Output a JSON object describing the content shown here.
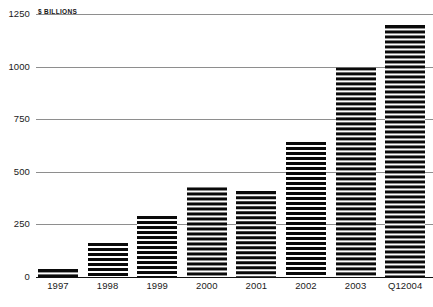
{
  "chart_data": {
    "type": "bar",
    "title": "",
    "subtitle": "",
    "unit_label": "$ BILLIONS",
    "xlabel": "",
    "ylabel": "$ Billions",
    "categories": [
      "1997",
      "1998",
      "1999",
      "2000",
      "2001",
      "2002",
      "2003",
      "Q12004"
    ],
    "values": [
      40,
      160,
      290,
      430,
      410,
      640,
      1000,
      1200
    ],
    "ylim": [
      0,
      1250
    ],
    "yticks": [
      0,
      250,
      500,
      750,
      1000,
      1250
    ],
    "ytick_labels": [
      "0",
      "250",
      "500",
      "750",
      "1000",
      "1250"
    ],
    "grid": true,
    "legend": null,
    "series": [
      {
        "name": "Value",
        "values": [
          40,
          160,
          290,
          430,
          410,
          640,
          1000,
          1200
        ]
      }
    ],
    "bar_fill": "horizontal-black-stripes",
    "colors": {
      "bar": "#0a0a0a",
      "gridline": "#8e8e8e",
      "baseline": "#111111",
      "text": "#1a1a1a",
      "background": "#ffffff"
    }
  }
}
